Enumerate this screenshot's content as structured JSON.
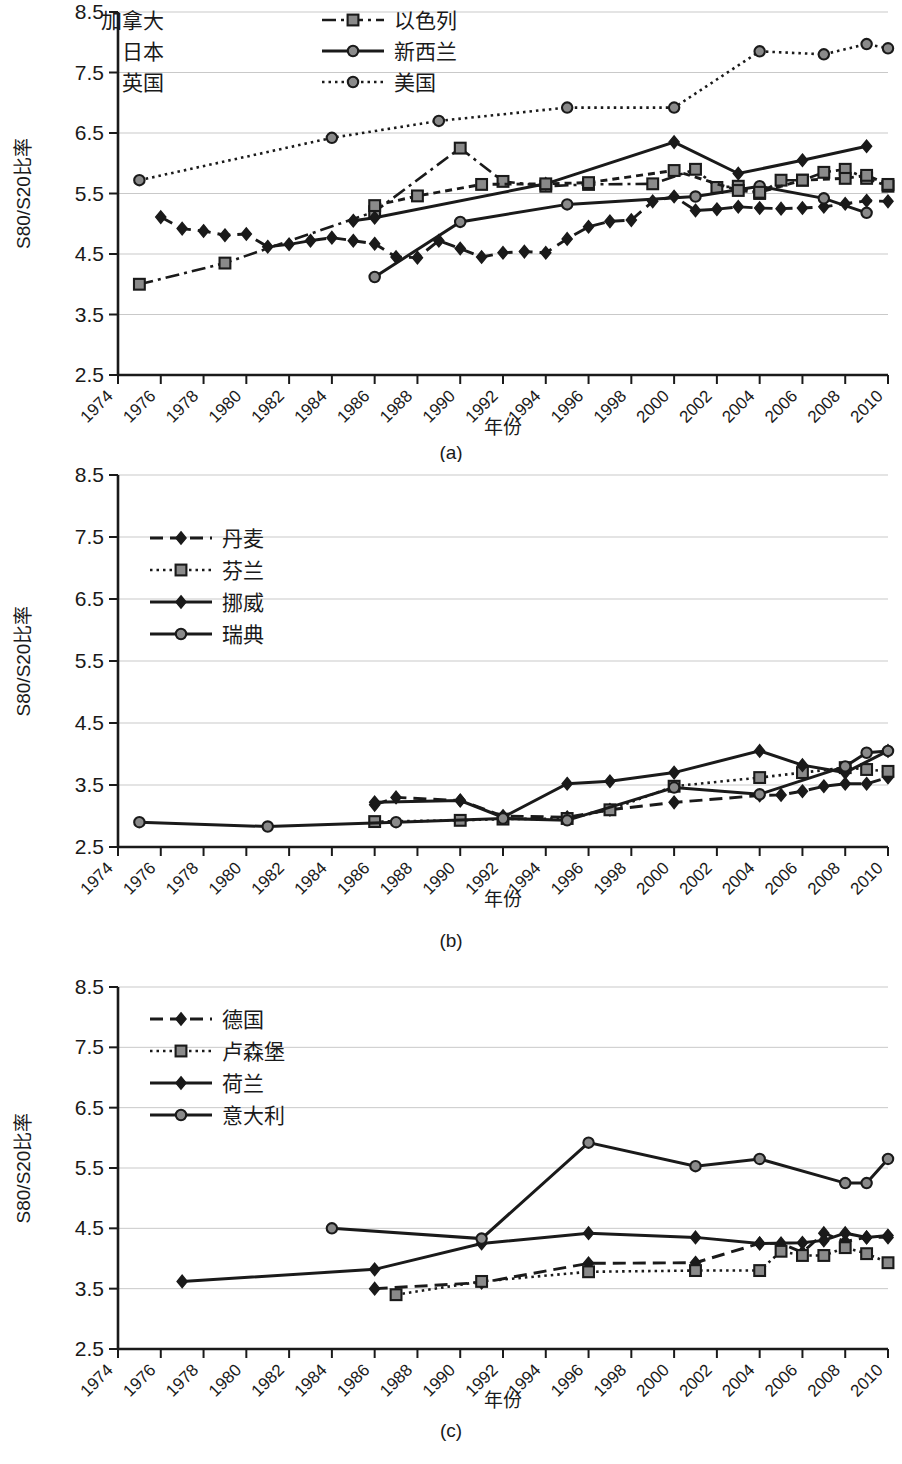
{
  "figure": {
    "background": "#ffffff",
    "line_color": "#1a1a1a",
    "grid_color": "#c9c9c9",
    "marker_fill_open": "#8a8a8a"
  },
  "panels": [
    {
      "id": "a",
      "caption": "(a)",
      "ylabel": "S80/S20比率",
      "xlabel": "年份",
      "legend_extra_labels": [
        "加拿大",
        "日本",
        "英国"
      ]
    },
    {
      "id": "b",
      "caption": "(b)",
      "ylabel": "S80/S20比率",
      "xlabel": "年份",
      "legend_extra_labels": []
    },
    {
      "id": "c",
      "caption": "(c)",
      "ylabel": "S80/S20比率",
      "xlabel": "年份",
      "legend_extra_labels": []
    }
  ],
  "chart_data": [
    {
      "type": "line",
      "panel": "a",
      "title": "(a)",
      "xlabel": "年份",
      "ylabel": "S80/S20比率",
      "xlim": [
        1974,
        2010
      ],
      "ylim": [
        2.5,
        8.5
      ],
      "yticks": [
        2.5,
        3.5,
        4.5,
        5.5,
        6.5,
        7.5,
        8.5
      ],
      "xticks": [
        1974,
        1976,
        1978,
        1980,
        1982,
        1984,
        1986,
        1988,
        1990,
        1992,
        1994,
        1996,
        1998,
        2000,
        2002,
        2004,
        2006,
        2008,
        2010
      ],
      "grid": "horizontal",
      "legend_position": "top-left",
      "legend_columns": 2,
      "series": [
        {
          "name": "加拿大",
          "style": "dashed",
          "marker": "diamond",
          "x": [
            1976,
            1977,
            1978,
            1979,
            1980,
            1981,
            1982,
            1983,
            1984,
            1985,
            1986,
            1987,
            1988,
            1989,
            1990,
            1991,
            1992,
            1993,
            1994,
            1995,
            1996,
            1997,
            1998,
            1999,
            2000,
            2001,
            2002,
            2003,
            2004,
            2005,
            2006,
            2007,
            2008,
            2009,
            2010
          ],
          "values": [
            5.11,
            4.92,
            4.88,
            4.81,
            4.83,
            4.62,
            4.66,
            4.72,
            4.77,
            4.72,
            4.67,
            4.45,
            4.44,
            4.72,
            4.59,
            4.45,
            4.52,
            4.54,
            4.52,
            4.75,
            4.95,
            5.04,
            5.06,
            5.37,
            5.45,
            5.22,
            5.24,
            5.28,
            5.26,
            5.25,
            5.26,
            5.28,
            5.33,
            5.38,
            5.37
          ]
        },
        {
          "name": "以色列",
          "style": "dash-dot",
          "marker": "square",
          "x": [
            1975,
            1979,
            1986,
            1990,
            1992,
            1994,
            1996,
            1999,
            2001,
            2002,
            2003,
            2004,
            2005,
            2006,
            2007,
            2008,
            2009,
            2010
          ],
          "values": [
            4.0,
            4.35,
            5.2,
            6.25,
            5.7,
            5.62,
            5.65,
            5.66,
            5.9,
            5.6,
            5.62,
            5.5,
            5.72,
            5.72,
            5.85,
            5.9,
            5.75,
            5.62
          ]
        },
        {
          "name": "日本",
          "style": "solid",
          "marker": "diamond",
          "x": [
            1985,
            1986,
            1994,
            2000,
            2003,
            2006,
            2009
          ],
          "values": [
            5.05,
            5.1,
            5.66,
            6.35,
            5.83,
            6.05,
            6.28
          ]
        },
        {
          "name": "新西兰",
          "style": "solid",
          "marker": "circle",
          "x": [
            1986,
            1990,
            1995,
            2001,
            2004,
            2007,
            2009
          ],
          "values": [
            4.12,
            5.03,
            5.32,
            5.45,
            5.62,
            5.42,
            5.18
          ]
        },
        {
          "name": "英国",
          "style": "dashed-short",
          "marker": "square",
          "x": [
            1986,
            1988,
            1991,
            1994,
            1996,
            2000,
            2003,
            2004,
            2006,
            2008,
            2009,
            2010
          ],
          "values": [
            5.3,
            5.46,
            5.65,
            5.66,
            5.68,
            5.88,
            5.55,
            5.52,
            5.72,
            5.75,
            5.8,
            5.65
          ]
        },
        {
          "name": "美国",
          "style": "dotted",
          "marker": "circle",
          "x": [
            1975,
            1984,
            1989,
            1995,
            2000,
            2004,
            2007,
            2009,
            2010
          ],
          "values": [
            5.72,
            6.42,
            6.7,
            6.92,
            6.92,
            7.85,
            7.8,
            7.97,
            7.9
          ]
        }
      ]
    },
    {
      "type": "line",
      "panel": "b",
      "title": "(b)",
      "xlabel": "年份",
      "ylabel": "S80/S20比率",
      "xlim": [
        1974,
        2010
      ],
      "ylim": [
        2.5,
        8.5
      ],
      "yticks": [
        2.5,
        3.5,
        4.5,
        5.5,
        6.5,
        7.5,
        8.5
      ],
      "xticks": [
        1974,
        1976,
        1978,
        1980,
        1982,
        1984,
        1986,
        1988,
        1990,
        1992,
        1994,
        1996,
        1998,
        2000,
        2002,
        2004,
        2006,
        2008,
        2010
      ],
      "grid": "horizontal",
      "legend_position": "left-middle",
      "legend_columns": 1,
      "series": [
        {
          "name": "丹麦",
          "style": "dashed",
          "marker": "diamond",
          "x": [
            1986,
            1987,
            1990,
            1992,
            1995,
            1997,
            2000,
            2004,
            2005,
            2006,
            2007,
            2008,
            2009,
            2010
          ],
          "values": [
            3.18,
            3.3,
            3.25,
            3.0,
            2.98,
            3.1,
            3.22,
            3.33,
            3.34,
            3.4,
            3.48,
            3.52,
            3.52,
            3.62
          ]
        },
        {
          "name": "芬兰",
          "style": "dotted",
          "marker": "square",
          "x": [
            1986,
            1990,
            1992,
            1995,
            1997,
            2000,
            2004,
            2006,
            2008,
            2009,
            2010
          ],
          "values": [
            2.91,
            2.93,
            2.95,
            2.96,
            3.1,
            3.48,
            3.62,
            3.7,
            3.78,
            3.75,
            3.72
          ]
        },
        {
          "name": "挪威",
          "style": "solid",
          "marker": "diamond",
          "x": [
            1986,
            1990,
            1992,
            1995,
            1997,
            2000,
            2004,
            2006,
            2008,
            2010
          ],
          "values": [
            3.22,
            3.25,
            2.98,
            3.52,
            3.56,
            3.7,
            4.05,
            3.82,
            3.7,
            4.05
          ]
        },
        {
          "name": "瑞典",
          "style": "solid",
          "marker": "circle",
          "x": [
            1975,
            1981,
            1987,
            1992,
            1995,
            2000,
            2004,
            2008,
            2009,
            2010
          ],
          "values": [
            2.9,
            2.83,
            2.9,
            2.96,
            2.93,
            3.46,
            3.35,
            3.8,
            4.02,
            4.05
          ]
        }
      ]
    },
    {
      "type": "line",
      "panel": "c",
      "title": "(c)",
      "xlabel": "年份",
      "ylabel": "S80/S20比率",
      "xlim": [
        1974,
        2010
      ],
      "ylim": [
        2.5,
        8.5
      ],
      "yticks": [
        2.5,
        3.5,
        4.5,
        5.5,
        6.5,
        7.5,
        8.5
      ],
      "xticks": [
        1974,
        1976,
        1978,
        1980,
        1982,
        1984,
        1986,
        1988,
        1990,
        1992,
        1994,
        1996,
        1998,
        2000,
        2002,
        2004,
        2006,
        2008,
        2010
      ],
      "grid": "horizontal",
      "legend_position": "left-middle",
      "legend_columns": 1,
      "series": [
        {
          "name": "德国",
          "style": "dashed",
          "marker": "diamond",
          "x": [
            1986,
            1991,
            1996,
            2001,
            2004,
            2005,
            2006,
            2007,
            2008,
            2009,
            2010
          ],
          "values": [
            3.5,
            3.6,
            3.92,
            3.93,
            4.25,
            4.25,
            4.1,
            4.42,
            4.28,
            4.35,
            4.35
          ]
        },
        {
          "name": "卢森堡",
          "style": "dotted",
          "marker": "square",
          "x": [
            1987,
            1991,
            1996,
            2001,
            2004,
            2005,
            2006,
            2007,
            2008,
            2009,
            2010
          ],
          "values": [
            3.4,
            3.62,
            3.78,
            3.8,
            3.8,
            4.12,
            4.05,
            4.05,
            4.18,
            4.08,
            3.93
          ]
        },
        {
          "name": "荷兰",
          "style": "solid",
          "marker": "diamond",
          "x": [
            1977,
            1986,
            1991,
            1996,
            2001,
            2004,
            2006,
            2007,
            2008,
            2009,
            2010
          ],
          "values": [
            3.62,
            3.82,
            4.25,
            4.42,
            4.35,
            4.25,
            4.26,
            4.3,
            4.42,
            4.35,
            4.38
          ]
        },
        {
          "name": "意大利",
          "style": "solid",
          "marker": "circle",
          "x": [
            1984,
            1991,
            1996,
            2001,
            2004,
            2008,
            2009,
            2010
          ],
          "values": [
            4.5,
            4.33,
            5.92,
            5.53,
            5.65,
            5.25,
            5.25,
            5.65
          ]
        }
      ]
    }
  ]
}
